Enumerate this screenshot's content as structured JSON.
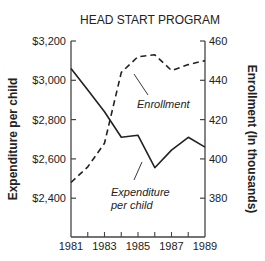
{
  "chart_data": {
    "type": "line",
    "title": "HEAD START PROGRAM",
    "xlabel": "",
    "x": [
      1981,
      1982,
      1983,
      1984,
      1985,
      1986,
      1987,
      1988,
      1989
    ],
    "x_tick_labels": [
      "1981",
      "1983",
      "1985",
      "1987",
      "1989"
    ],
    "y_left": {
      "label": "Expenditure per child",
      "range": [
        2200,
        3200
      ],
      "tick_labels": [
        "$3,200",
        "$3,000",
        "$2,800",
        "$2,600",
        "$2,400"
      ],
      "tick_values": [
        3200,
        3000,
        2800,
        2600,
        2400
      ]
    },
    "y_right": {
      "label": "Enrollment (In thousands)",
      "range": [
        360,
        460
      ],
      "tick_labels": [
        "460",
        "440",
        "420",
        "400",
        "380"
      ],
      "tick_values": [
        460,
        440,
        420,
        400,
        380
      ]
    },
    "series": [
      {
        "name": "Expenditure per child",
        "axis": "left",
        "style": "solid",
        "values": [
          3060,
          2950,
          2840,
          2710,
          2720,
          2555,
          2645,
          2710,
          2660
        ]
      },
      {
        "name": "Enrollment",
        "axis": "right",
        "style": "dashed",
        "values": [
          388,
          396,
          408,
          444,
          452,
          453,
          445,
          448,
          450
        ]
      }
    ],
    "annotations": [
      {
        "text": "Enrollment",
        "target": "Enrollment"
      },
      {
        "text": "Expenditure per child",
        "lines": [
          "Expenditure",
          "per child"
        ],
        "target": "Expenditure per child"
      }
    ],
    "grid": false,
    "legend": "none (inline annotations)"
  },
  "labels": {
    "title": "HEAD START PROGRAM",
    "y_left_title": "Expenditure per child",
    "y_right_title": "Enrollment (In thousands)",
    "annot_enrollment": "Enrollment",
    "annot_expenditure_1": "Expenditure",
    "annot_expenditure_2": "per child"
  },
  "colors": {
    "line": "#222222",
    "axis": "#444444",
    "background": "#ffffff"
  }
}
